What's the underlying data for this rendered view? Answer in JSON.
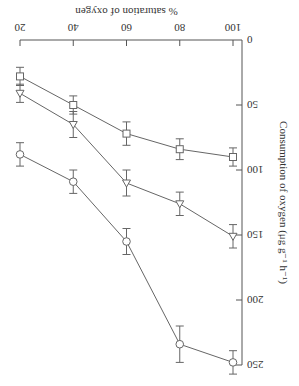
{
  "chart_data": {
    "type": "line",
    "orientation_note": "figure displayed rotated 180 degrees",
    "title": "",
    "xlabel": "% saturation of oxygen",
    "ylabel": "Consumption of oxygen (μg g⁻¹ h⁻¹)",
    "x": [
      20,
      40,
      60,
      80,
      100
    ],
    "xlim": [
      20,
      100
    ],
    "ylim": [
      0,
      250
    ],
    "x_ticks": [
      "20",
      "40",
      "60",
      "80",
      "100"
    ],
    "y_ticks": [
      "0",
      "50",
      "100",
      "150",
      "200",
      "250"
    ],
    "grid": false,
    "legend": null,
    "series": [
      {
        "name": "square",
        "marker": "square",
        "values": [
          28,
          50,
          72,
          84,
          90
        ],
        "errors": [
          7,
          7,
          9,
          8,
          7
        ]
      },
      {
        "name": "triangle",
        "marker": "triangle-down",
        "values": [
          41,
          65,
          110,
          126,
          151
        ],
        "errors": [
          7,
          10,
          10,
          9,
          9
        ]
      },
      {
        "name": "circle",
        "marker": "circle",
        "values": [
          88,
          109,
          155,
          234,
          248
        ],
        "errors": [
          9,
          9,
          10,
          14,
          9
        ]
      }
    ]
  }
}
